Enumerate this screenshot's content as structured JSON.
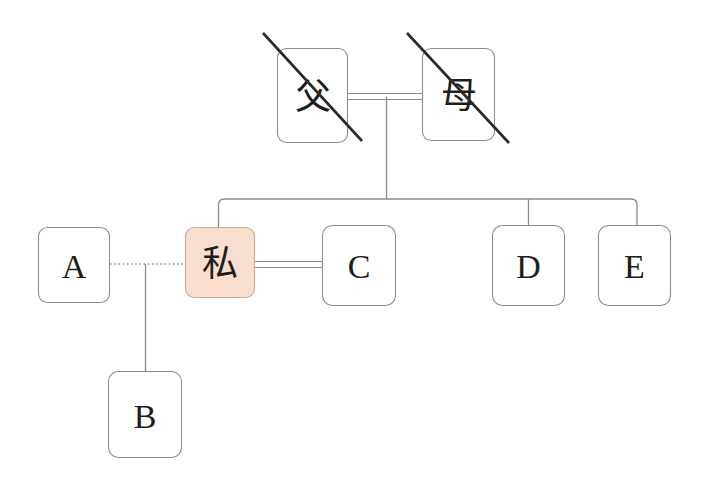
{
  "diagram": {
    "background_color": "#ffffff",
    "line_color": "#8d8d86",
    "strike_color": "#2c2a27",
    "self_fill_color": "#f9ddcf",
    "self_border_color": "#cbae9e",
    "nodes": [
      {
        "id": "father",
        "label": "父",
        "script": "cjk",
        "deceased": true,
        "highlighted": false
      },
      {
        "id": "mother",
        "label": "母",
        "script": "cjk",
        "deceased": true,
        "highlighted": false
      },
      {
        "id": "a",
        "label": "A",
        "script": "latin",
        "deceased": false,
        "highlighted": false
      },
      {
        "id": "self",
        "label": "私",
        "script": "cjk",
        "deceased": false,
        "highlighted": true
      },
      {
        "id": "c",
        "label": "C",
        "script": "latin",
        "deceased": false,
        "highlighted": false
      },
      {
        "id": "d",
        "label": "D",
        "script": "latin",
        "deceased": false,
        "highlighted": false
      },
      {
        "id": "e",
        "label": "E",
        "script": "latin",
        "deceased": false,
        "highlighted": false
      },
      {
        "id": "b",
        "label": "B",
        "script": "latin",
        "deceased": false,
        "highlighted": false
      }
    ],
    "links": [
      {
        "from": "father",
        "to": "mother",
        "style": "double-solid",
        "meaning": "marriage"
      },
      {
        "from": "a",
        "to": "self",
        "style": "dotted",
        "meaning": "former-or-unofficial-union"
      },
      {
        "from": "self",
        "to": "c",
        "style": "double-solid",
        "meaning": "marriage"
      },
      {
        "from": "parents",
        "to": "self",
        "style": "single-solid",
        "meaning": "descent"
      },
      {
        "from": "parents",
        "to": "d",
        "style": "single-solid",
        "meaning": "descent"
      },
      {
        "from": "parents",
        "to": "e",
        "style": "single-solid",
        "meaning": "descent"
      },
      {
        "from": "a-self",
        "to": "b",
        "style": "single-solid",
        "meaning": "descent"
      }
    ]
  }
}
